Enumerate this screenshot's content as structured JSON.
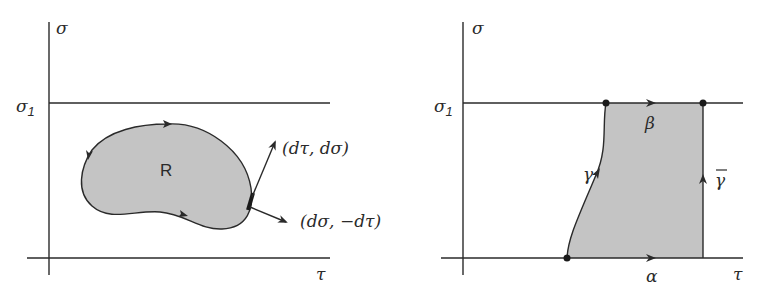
{
  "colors": {
    "ink": "#2a2a2a",
    "region_fill": "#c4c4c4",
    "background": "#ffffff"
  },
  "left_panel": {
    "vertical_axis_label": "σ",
    "horizontal_axis_label": "τ",
    "upper_bound_label": "σ",
    "upper_bound_subscript": "1",
    "region_label": "R",
    "tangent_vector_label": "(dτ, dσ)",
    "normal_vector_label": "(dσ, −dτ)",
    "boundary_orientation": "counterclockwise"
  },
  "right_panel": {
    "vertical_axis_label": "σ",
    "horizontal_axis_label": "τ",
    "upper_bound_label": "σ",
    "upper_bound_subscript": "1",
    "bottom_edge_label": "α",
    "top_edge_label": "β",
    "left_curve_label": "γ",
    "right_edge_label": "γ̄",
    "vertices": 3
  }
}
